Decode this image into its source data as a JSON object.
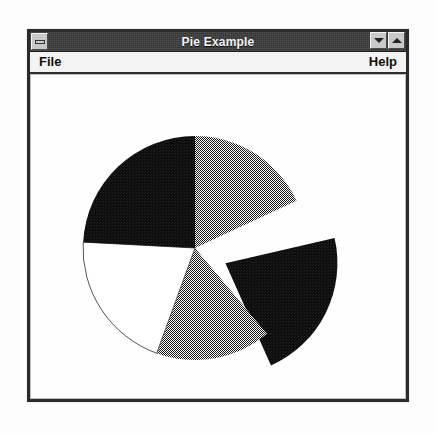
{
  "window": {
    "title": "Pie Example",
    "minimize_icon": "minimize-bar-icon",
    "restore_down_icon": "triangle-down-icon",
    "maximize_icon": "triangle-up-icon"
  },
  "menu": {
    "items": [
      {
        "label": "File",
        "align": "left"
      },
      {
        "label": "Help",
        "align": "right"
      }
    ]
  },
  "colors": {
    "title_bar": "#3a3a3a",
    "title_text": "#f4f4f4",
    "menu_bar": "#f3f3f3",
    "window_frame": "#2b2b2b",
    "client_background": "#ffffff",
    "slice_black": "#111111",
    "slice_gray": "#6e6e6e",
    "slice_white": "#ffffff",
    "slice_outline": "#555555"
  },
  "chart_data": {
    "type": "pie",
    "title": "",
    "center": {
      "x": 195,
      "y": 248
    },
    "radius": 112,
    "start_angle_deg": -90,
    "direction": "clockwise",
    "legend": "none",
    "grid": false,
    "categories": [
      "Slice 1",
      "Slice 2",
      "Slice 3",
      "Slice 4",
      "Slice 5"
    ],
    "values": [
      18,
      22,
      20,
      18,
      22
    ],
    "slices": [
      {
        "name": "Slice 1",
        "value": 18,
        "percent": 18,
        "start_deg": -90,
        "end_deg": -25,
        "fill": "gray",
        "exploded": false,
        "explode_offset": 0
      },
      {
        "name": "Slice 2",
        "value": 22,
        "percent": 22,
        "start_deg": -13,
        "end_deg": 66,
        "fill": "black",
        "exploded": true,
        "explode_offset": 34
      },
      {
        "name": "Slice 3",
        "value": 20,
        "percent": 20,
        "start_deg": 50,
        "end_deg": 110,
        "fill": "gray",
        "exploded": false,
        "explode_offset": 0
      },
      {
        "name": "Slice 4",
        "value": 18,
        "percent": 18,
        "start_deg": 110,
        "end_deg": 183,
        "fill": "white",
        "exploded": false,
        "explode_offset": 0
      },
      {
        "name": "Slice 5",
        "value": 22,
        "percent": 22,
        "start_deg": 183,
        "end_deg": 270,
        "fill": "black",
        "exploded": false,
        "explode_offset": 0
      }
    ]
  }
}
